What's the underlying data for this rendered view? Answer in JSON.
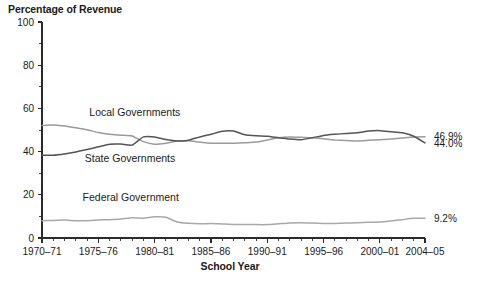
{
  "chart_data": {
    "type": "line",
    "title": "Percentage of Revenue",
    "xlabel": "School Year",
    "ylabel": "",
    "ylim": [
      0,
      100
    ],
    "ytick_values": [
      0,
      20,
      40,
      60,
      80,
      100
    ],
    "ytick_labels": [
      "0",
      "20",
      "40",
      "60",
      "80",
      "100"
    ],
    "yminor_step": 10,
    "grid": false,
    "legend": "inline-labels",
    "x": [
      "1970-71",
      "1971-72",
      "1972-73",
      "1973-74",
      "1974-75",
      "1975-76",
      "1976-77",
      "1977-78",
      "1978-79",
      "1979-80",
      "1980-81",
      "1981-82",
      "1982-83",
      "1983-84",
      "1984-85",
      "1985-86",
      "1986-87",
      "1987-88",
      "1988-89",
      "1989-90",
      "1990-91",
      "1991-92",
      "1992-93",
      "1993-94",
      "1994-95",
      "1995-96",
      "1996-97",
      "1997-98",
      "1998-99",
      "1999-2000",
      "2000-01",
      "2001-02",
      "2002-03",
      "2003-04",
      "2004-05"
    ],
    "xtick_labels": [
      "1970–71",
      "1975–76",
      "1980–81",
      "1985–86",
      "1990–91",
      "1995–96",
      "2000–01",
      "2004–05"
    ],
    "xtick_positions": [
      0,
      5,
      10,
      15,
      20,
      25,
      30,
      34
    ],
    "series": [
      {
        "name": "Local Governments",
        "color": "#9a9a9a",
        "end_label": "46.9%",
        "label_x_index": 4.2,
        "label_y": 56.5,
        "values": [
          52.1,
          52.3,
          51.8,
          51.0,
          50.1,
          48.8,
          48.0,
          47.6,
          47.2,
          44.6,
          43.4,
          43.9,
          44.9,
          45.0,
          44.4,
          43.9,
          43.9,
          43.9,
          44.1,
          44.4,
          45.4,
          46.4,
          46.8,
          46.6,
          46.4,
          45.9,
          45.4,
          45.1,
          44.9,
          45.2,
          45.5,
          45.8,
          46.3,
          46.8,
          46.9
        ],
        "linewidth": 1.5
      },
      {
        "name": "State Governments",
        "color": "#545454",
        "end_label": "44.0%",
        "label_x_index": 3.8,
        "label_y": 35.0,
        "values": [
          38.3,
          38.3,
          38.9,
          39.8,
          41.0,
          42.2,
          43.4,
          43.5,
          43.0,
          46.8,
          46.8,
          45.6,
          44.9,
          45.3,
          46.8,
          48.0,
          49.4,
          49.5,
          47.8,
          47.3,
          47.1,
          46.4,
          45.8,
          45.5,
          46.4,
          47.5,
          48.0,
          48.4,
          48.7,
          49.5,
          49.7,
          49.2,
          48.7,
          47.1,
          44.0
        ],
        "linewidth": 1.5
      },
      {
        "name": "Federal Government",
        "color": "#a8a8a8",
        "end_label": "9.2%",
        "label_x_index": 3.6,
        "label_y": 17.0,
        "values": [
          8.0,
          8.1,
          8.3,
          8.0,
          8.0,
          8.3,
          8.5,
          8.8,
          9.4,
          9.2,
          9.8,
          9.6,
          7.4,
          6.8,
          6.6,
          6.7,
          6.5,
          6.3,
          6.3,
          6.2,
          6.2,
          6.6,
          7.0,
          7.1,
          6.9,
          6.7,
          6.7,
          6.9,
          7.1,
          7.3,
          7.4,
          7.9,
          8.5,
          9.1,
          9.2
        ],
        "linewidth": 1.5
      }
    ]
  }
}
